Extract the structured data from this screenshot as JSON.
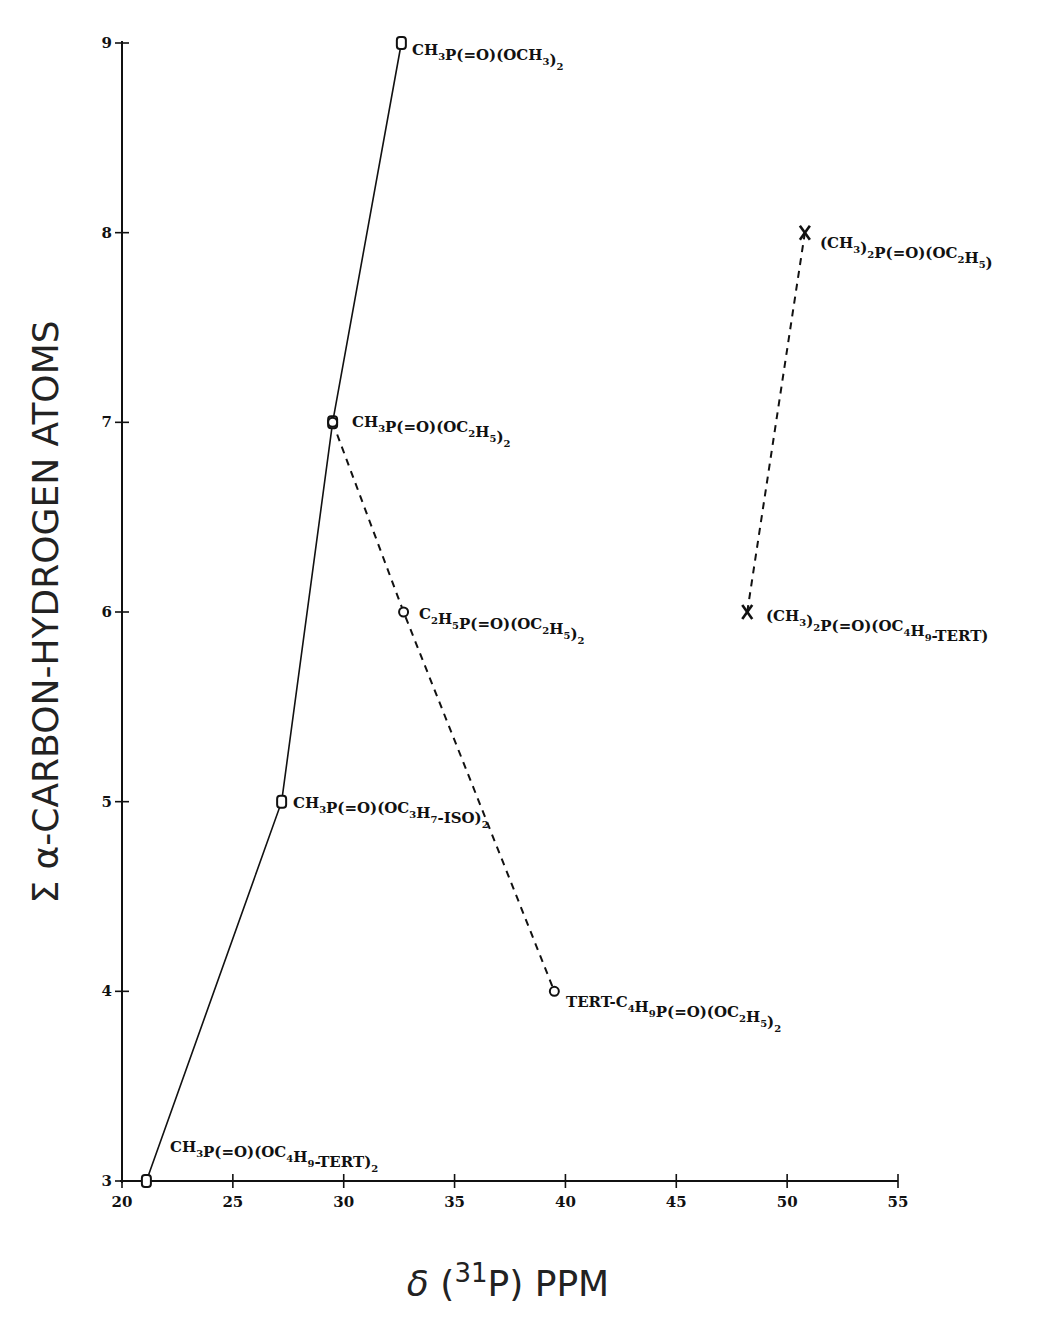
{
  "chart_data": {
    "type": "scatter",
    "title": "",
    "xlabel": "δ (³¹P) PPM",
    "xlabel_parts": {
      "prefix": "δ (",
      "sup": "31",
      "mid": "P)",
      "suffix": "PPM"
    },
    "ylabel": "Σ α-CARBON-HYDROGEN ATOMS",
    "xlim": [
      20,
      55
    ],
    "ylim": [
      3,
      9
    ],
    "xticks": [
      20,
      25,
      30,
      35,
      40,
      45,
      50,
      55
    ],
    "yticks": [
      3,
      4,
      5,
      6,
      7,
      8,
      9
    ],
    "grid": false,
    "legend": null,
    "series": [
      {
        "name": "CH3P(=O)(OR)2",
        "marker": "square-ish",
        "line": "solid",
        "points": [
          {
            "x": 21.1,
            "y": 3,
            "label": "CH3P(=O)(OC4H9-TERT)2"
          },
          {
            "x": 27.2,
            "y": 5,
            "label": "CH3P(=O)(OC3H7-ISO)2"
          },
          {
            "x": 29.5,
            "y": 7,
            "label": "CH3P(=O)(OC2H5)2"
          },
          {
            "x": 32.6,
            "y": 9,
            "label": "CH3P(=O)(OCH3)2"
          }
        ]
      },
      {
        "name": "RP(=O)(OC2H5)2",
        "marker": "circle",
        "line": "dashed",
        "points": [
          {
            "x": 29.5,
            "y": 7,
            "label": "CH3P(=O)(OC2H5)2"
          },
          {
            "x": 32.7,
            "y": 6,
            "label": "C2H5P(=O)(OC2H5)2"
          },
          {
            "x": 39.5,
            "y": 4,
            "label": "TERT-C4H9P(=O)(OC2H5)2"
          }
        ]
      },
      {
        "name": "(CH3)2P(=O)(OR)",
        "marker": "x",
        "line": "dashed",
        "points": [
          {
            "x": 48.2,
            "y": 6,
            "label": "(CH3)2P(=O)(OC4H9-TERT)"
          },
          {
            "x": 50.8,
            "y": 8,
            "label": "(CH3)2P(=O)(OC2H5)"
          }
        ]
      }
    ]
  },
  "labels": {
    "p_och3": [
      [
        "CH",
        ""
      ],
      [
        "3",
        "s"
      ],
      [
        "P(=O)(OCH",
        ""
      ],
      [
        "3",
        "s"
      ],
      [
        ")",
        ""
      ],
      [
        "2",
        "s"
      ]
    ],
    "p_oc2h5": [
      [
        "CH",
        ""
      ],
      [
        "3",
        "s"
      ],
      [
        "P(=O)(OC",
        ""
      ],
      [
        "2",
        "s"
      ],
      [
        "H",
        ""
      ],
      [
        "5",
        "s"
      ],
      [
        ")",
        ""
      ],
      [
        "2",
        "s"
      ]
    ],
    "p_iso": [
      [
        "CH",
        ""
      ],
      [
        "3",
        "s"
      ],
      [
        "P(=O)(OC",
        ""
      ],
      [
        "3",
        "s"
      ],
      [
        "H",
        ""
      ],
      [
        "7",
        "s"
      ],
      [
        "-ISO)",
        ""
      ],
      [
        "2",
        "s"
      ]
    ],
    "p_tert2": [
      [
        "CH",
        ""
      ],
      [
        "3",
        "s"
      ],
      [
        "P(=O)(OC",
        ""
      ],
      [
        "4",
        "s"
      ],
      [
        "H",
        ""
      ],
      [
        "9",
        "s"
      ],
      [
        "-TERT)",
        ""
      ],
      [
        "2",
        "s"
      ]
    ],
    "p_et": [
      [
        "C",
        ""
      ],
      [
        "2",
        "s"
      ],
      [
        "H",
        ""
      ],
      [
        "5",
        "s"
      ],
      [
        "P(=O)(OC",
        ""
      ],
      [
        "2",
        "s"
      ],
      [
        "H",
        ""
      ],
      [
        "5",
        "s"
      ],
      [
        ")",
        ""
      ],
      [
        "2",
        "s"
      ]
    ],
    "p_tbu": [
      [
        "TERT-C",
        ""
      ],
      [
        "4",
        "s"
      ],
      [
        "H",
        ""
      ],
      [
        "9",
        "s"
      ],
      [
        "P(=O)(OC",
        ""
      ],
      [
        "2",
        "s"
      ],
      [
        "H",
        ""
      ],
      [
        "5",
        "s"
      ],
      [
        ")",
        ""
      ],
      [
        "2",
        "s"
      ]
    ],
    "p_dm_et": [
      [
        "(CH",
        ""
      ],
      [
        "3",
        "s"
      ],
      [
        ")",
        ""
      ],
      [
        "2",
        "s"
      ],
      [
        "P(=O)(OC",
        ""
      ],
      [
        "2",
        "s"
      ],
      [
        "H",
        ""
      ],
      [
        "5",
        "s"
      ],
      [
        ")",
        ""
      ]
    ],
    "p_dm_tbu": [
      [
        "(CH",
        ""
      ],
      [
        "3",
        "s"
      ],
      [
        ")",
        ""
      ],
      [
        "2",
        "s"
      ],
      [
        "P(=O)(OC",
        ""
      ],
      [
        "4",
        "s"
      ],
      [
        "H",
        ""
      ],
      [
        "9",
        "s"
      ],
      [
        "-TERT)",
        ""
      ]
    ]
  }
}
